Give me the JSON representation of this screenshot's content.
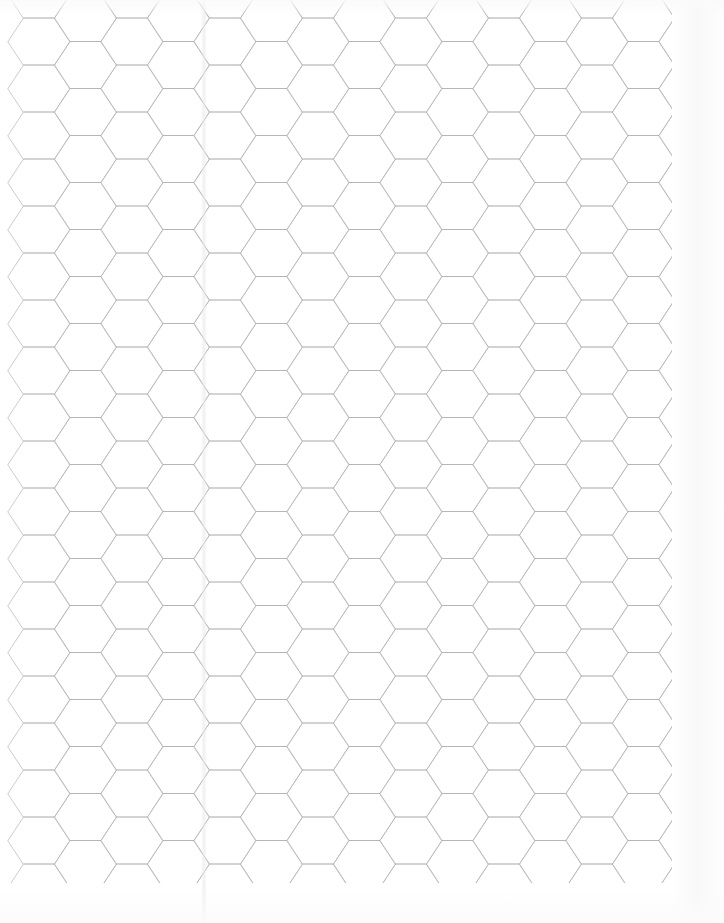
{
  "document": {
    "kind": "hex-graph-paper-scan",
    "title": "Hexagonal Graph Paper Sheet",
    "page_width_px": 724,
    "page_height_px": 923,
    "background_color": "#ffffff",
    "line_color": "#a8a8ac",
    "line_width_px": 0.6,
    "text_content": [],
    "visible_labels": []
  },
  "grid": {
    "orientation": "flat-top",
    "hex_width_px": 62,
    "hex_height_px": 47,
    "column_pitch_px": 46.5,
    "row_pitch_px": 47,
    "column_offset_px": 23.5,
    "origin_x_px": 8,
    "origin_y_px": 18,
    "columns": 15,
    "rows": 20,
    "right_edge_px": 672,
    "bottom_edge_px": 883
  },
  "artifacts": {
    "fold_line_x_px": 204,
    "fold_line_label": "vertical scanner seam",
    "right_shadow_label": "paper edge shading",
    "top_shadow_label": "paper top edge shading",
    "bottom_shadow_label": "paper bottom edge shading"
  }
}
